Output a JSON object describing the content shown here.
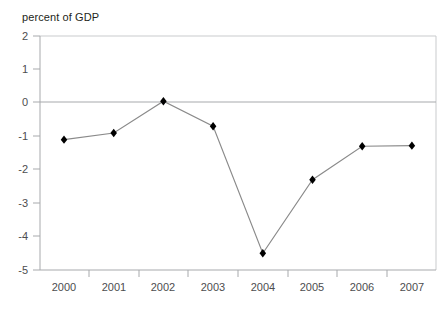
{
  "chart_data": {
    "type": "line",
    "title": "",
    "ylabel": "percent of GDP",
    "xlabel": "",
    "categories": [
      "2000",
      "2001",
      "2002",
      "2003",
      "2004",
      "2005",
      "2006",
      "2007"
    ],
    "values": [
      -1.1,
      -0.9,
      0.05,
      -0.7,
      -4.5,
      -2.3,
      -1.3,
      -1.28
    ],
    "series": [
      {
        "name": "percent of GDP",
        "values": [
          -1.1,
          -0.9,
          0.05,
          -0.7,
          -4.5,
          -2.3,
          -1.3,
          -1.28
        ]
      }
    ],
    "ylim": [
      -5,
      2
    ],
    "yticks": [
      2,
      1,
      0,
      -1,
      -2,
      -3,
      -4,
      -5
    ],
    "ytick_labels": [
      "2",
      "1",
      "0",
      "-1",
      "-2",
      "-3",
      "-4",
      "-5"
    ],
    "xtick_labels": [
      "2000",
      "2001",
      "2002",
      "2003",
      "2004",
      "2005",
      "2006",
      "2007"
    ],
    "grid": false,
    "zero_line": true,
    "legend": "none",
    "marker": "diamond",
    "line_color": "#808080",
    "marker_color": "#000000",
    "axis_color": "#a7a9ac"
  },
  "figure": {
    "axis_title": "percent of GDP"
  }
}
